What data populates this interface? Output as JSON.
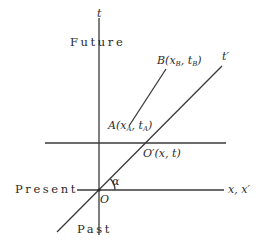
{
  "diagram": {
    "type": "spacetime-diagram",
    "axes": {
      "time_axis_label": "t",
      "moving_time_axis_label": "t′",
      "space_axis_label": "x, x′"
    },
    "regions": {
      "future": "Future",
      "present": "Present",
      "past": "Past"
    },
    "points": {
      "origin": "O",
      "moved_origin": "O′(x, t)",
      "event_a": {
        "name": "A",
        "open": "(x",
        "sub1": "A",
        "mid": ", t",
        "sub2": "A",
        "close": ")"
      },
      "event_b": {
        "name": "B",
        "open": "(x",
        "sub1": "B",
        "mid": ", t",
        "sub2": "B",
        "close": ")"
      }
    },
    "angle_label": "α",
    "colors": {
      "ink": "#2a2a2a",
      "background": "#ffffff"
    }
  }
}
